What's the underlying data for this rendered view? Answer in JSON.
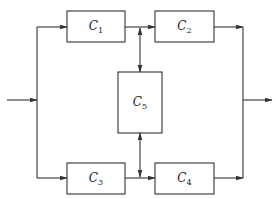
{
  "diagram": {
    "type": "block-diagram",
    "colors": {
      "stroke": "#333333",
      "background": "#ffffff",
      "text": "#222222"
    },
    "blocks": [
      {
        "id": "C1",
        "letter": "C",
        "sub": "1",
        "x": 67,
        "y": 11,
        "w": 58,
        "h": 31
      },
      {
        "id": "C2",
        "letter": "C",
        "sub": "2",
        "x": 155,
        "y": 11,
        "w": 59,
        "h": 31
      },
      {
        "id": "C5",
        "letter": "C",
        "sub": "5",
        "x": 118,
        "y": 72,
        "w": 44,
        "h": 61
      },
      {
        "id": "C3",
        "letter": "C",
        "sub": "3",
        "x": 67,
        "y": 163,
        "w": 58,
        "h": 31
      },
      {
        "id": "C4",
        "letter": "C",
        "sub": "4",
        "x": 155,
        "y": 163,
        "w": 59,
        "h": 31
      }
    ],
    "connections": [
      {
        "from": "input",
        "to": "split",
        "label": ""
      },
      {
        "from": "split",
        "to": "C1",
        "label": ""
      },
      {
        "from": "split",
        "to": "C3",
        "label": ""
      },
      {
        "from": "C1",
        "to": "C2",
        "label": ""
      },
      {
        "from": "C3",
        "to": "C4",
        "label": ""
      },
      {
        "from": "C1-C2 link",
        "to": "C5",
        "bidirectional": true,
        "label": ""
      },
      {
        "from": "C5",
        "to": "C3-C4 link",
        "bidirectional": true,
        "label": ""
      },
      {
        "from": "C2",
        "to": "merge",
        "label": ""
      },
      {
        "from": "C4",
        "to": "merge",
        "label": ""
      },
      {
        "from": "merge",
        "to": "output",
        "label": ""
      }
    ]
  }
}
